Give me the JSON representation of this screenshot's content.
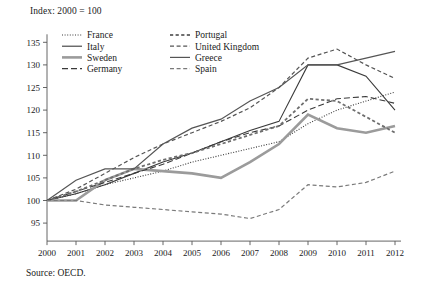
{
  "figure": {
    "index_note": "Index: 2000 = 100",
    "source_note": "Source: OECD."
  },
  "chart_data": {
    "type": "line",
    "title": "",
    "subtitle": "Index: 2000 = 100",
    "xlabel": "",
    "ylabel": "",
    "xlim": [
      2000,
      2012
    ],
    "ylim": [
      93,
      137
    ],
    "yticks": [
      95,
      100,
      105,
      110,
      115,
      120,
      125,
      130,
      135
    ],
    "ytick_labels": [
      "95",
      "100",
      "105",
      "110",
      "115",
      "120",
      "125",
      "130",
      "135"
    ],
    "grid": false,
    "legend_position": "top-left-inside",
    "x": [
      2000,
      2001,
      2002,
      2003,
      2004,
      2005,
      2006,
      2007,
      2008,
      2009,
      2010,
      2011,
      2012
    ],
    "xtick_labels": [
      "2000",
      "2001",
      "2002",
      "2003",
      "2004",
      "2005",
      "2006",
      "2007",
      "2008",
      "2009",
      "2010",
      "2011",
      "2012"
    ],
    "series": [
      {
        "name": "France",
        "style": "dotted",
        "color": "#3a3a3a",
        "width": 1.1,
        "values": [
          100.0,
          101.5,
          103.5,
          105.0,
          106.5,
          108.5,
          110.0,
          111.5,
          113.0,
          117.0,
          120.0,
          122.0,
          124.0
        ]
      },
      {
        "name": "Italy",
        "style": "solid",
        "color": "#3a3a3a",
        "width": 1.1,
        "values": [
          100.0,
          101.5,
          103.5,
          106.0,
          108.5,
          110.5,
          113.0,
          115.5,
          117.5,
          130.0,
          130.0,
          127.5,
          120.0
        ]
      },
      {
        "name": "Sweden",
        "style": "solid-thick",
        "color": "#9b9b9b",
        "width": 2.6,
        "values": [
          100.0,
          100.0,
          104.5,
          107.0,
          106.5,
          106.0,
          105.0,
          108.5,
          112.5,
          119.0,
          116.0,
          115.0,
          116.5
        ]
      },
      {
        "name": "Germany",
        "style": "dashed-long",
        "color": "#3a3a3a",
        "width": 1.1,
        "values": [
          100.0,
          102.0,
          104.0,
          106.0,
          108.0,
          110.5,
          113.0,
          115.0,
          116.5,
          120.0,
          122.5,
          123.0,
          121.5
        ]
      },
      {
        "name": "Portugal",
        "style": "dashed-dot",
        "color": "#6e6e6e",
        "width": 1.8,
        "values": [
          100.0,
          102.0,
          104.5,
          107.0,
          109.0,
          110.5,
          112.5,
          114.5,
          116.5,
          122.5,
          122.0,
          118.5,
          115.0
        ]
      },
      {
        "name": "United Kingdom",
        "style": "dashed",
        "color": "#555555",
        "width": 1.2,
        "values": [
          100.0,
          102.5,
          106.0,
          109.5,
          112.5,
          115.0,
          117.5,
          120.5,
          125.0,
          131.5,
          133.5,
          130.0,
          127.0
        ]
      },
      {
        "name": "Greece",
        "style": "solid",
        "color": "#555555",
        "width": 1.2,
        "values": [
          100.0,
          104.5,
          107.0,
          107.0,
          112.5,
          116.0,
          118.0,
          122.0,
          125.0,
          130.0,
          130.0,
          131.5,
          133.0
        ]
      },
      {
        "name": "Spain",
        "style": "dashed",
        "color": "#7a7a7a",
        "width": 1.2,
        "values": [
          100.0,
          100.0,
          99.0,
          98.5,
          98.0,
          97.5,
          97.0,
          96.0,
          98.0,
          103.5,
          103.0,
          104.0,
          106.5
        ]
      }
    ],
    "legend": [
      {
        "label": "France",
        "style": "dotted",
        "color": "#3a3a3a",
        "width": 1.1
      },
      {
        "label": "Italy",
        "style": "solid",
        "color": "#3a3a3a",
        "width": 1.1
      },
      {
        "label": "Sweden",
        "style": "solid-thick",
        "color": "#9b9b9b",
        "width": 2.6
      },
      {
        "label": "Germany",
        "style": "dashed-long",
        "color": "#3a3a3a",
        "width": 1.1
      },
      {
        "label": "Portugal",
        "style": "dashed-dot",
        "color": "#6e6e6e",
        "width": 1.8
      },
      {
        "label": "United Kingdom",
        "style": "dashed",
        "color": "#555555",
        "width": 1.2
      },
      {
        "label": "Greece",
        "style": "solid",
        "color": "#555555",
        "width": 1.2
      },
      {
        "label": "Spain",
        "style": "dashed",
        "color": "#7a7a7a",
        "width": 1.2
      }
    ]
  }
}
